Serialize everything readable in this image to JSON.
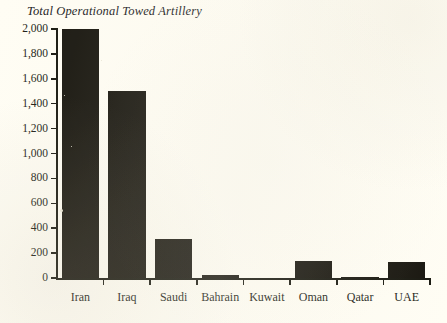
{
  "chart_data": {
    "type": "bar",
    "title": "Total Operational Towed Artillery",
    "xlabel": "",
    "ylabel": "",
    "categories": [
      "Iran",
      "Iraq",
      "Saudi",
      "Bahrain",
      "Kuwait",
      "Oman",
      "Qatar",
      "UAE"
    ],
    "values": [
      2000,
      1500,
      310,
      26,
      0,
      135,
      12,
      130
    ],
    "ylim": [
      0,
      2000
    ],
    "yticks": [
      0,
      200,
      400,
      600,
      800,
      1000,
      1200,
      1400,
      1600,
      1800,
      2000
    ],
    "ytick_labels": [
      "0",
      "200",
      "400",
      "600",
      "800",
      "1,000",
      "1,200",
      "1,400",
      "1,600",
      "1,800",
      "2,000"
    ],
    "grid": false,
    "legend": null,
    "bar_color": "#17150e",
    "background_color": "#fffdf4",
    "axis_color": "#17170f"
  }
}
